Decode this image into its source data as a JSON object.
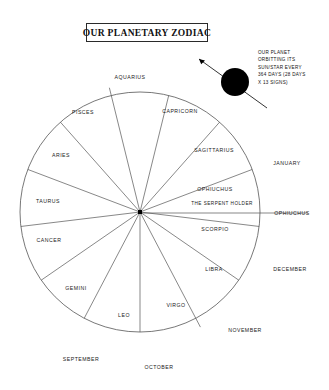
{
  "title": {
    "text": "OUR PLANETARY ZODIAC"
  },
  "annotation": {
    "lines": [
      "OUR PLANET",
      "ORBITTING ITS",
      "SUN/STAR EVERY",
      "364 DAYS (28 DAYS",
      "X 13 SIGNS)"
    ]
  },
  "wheel": {
    "center_x": 140,
    "center_y": 212,
    "radius": 120,
    "sector_count": 13,
    "stroke_color": "#555555",
    "planet_color": "#000000"
  },
  "signs": [
    {
      "name": "AQUARIUS",
      "x": 130,
      "y": 77
    },
    {
      "name": "PISCES",
      "x": 83,
      "y": 112
    },
    {
      "name": "ARIES",
      "x": 61,
      "y": 155
    },
    {
      "name": "TAURUS",
      "x": 48,
      "y": 201
    },
    {
      "name": "CANCER",
      "x": 49,
      "y": 240
    },
    {
      "name": "GEMINI",
      "x": 76,
      "y": 288
    },
    {
      "name": "LEO",
      "x": 124,
      "y": 315
    },
    {
      "name": "VIRGO",
      "x": 176,
      "y": 305
    },
    {
      "name": "LIBRA",
      "x": 214,
      "y": 269
    },
    {
      "name": "SCORPIO",
      "x": 215,
      "y": 229
    },
    {
      "name": "OPHIUCHUS",
      "x": 215,
      "y": 189
    },
    {
      "name": "SAGITTARIUS",
      "x": 214,
      "y": 150
    },
    {
      "name": "CAPRICORN",
      "x": 180,
      "y": 111
    }
  ],
  "sign_subtitle": {
    "name": "THE SERPENT HOLDER",
    "x": 222,
    "y": 203
  },
  "outer_labels": [
    {
      "name": "JANUARY",
      "x": 287,
      "y": 163
    },
    {
      "name": "OPHIUCHUS",
      "x": 292,
      "y": 213
    },
    {
      "name": "DECEMBER",
      "x": 290,
      "y": 269
    },
    {
      "name": "NOVEMBER",
      "x": 245,
      "y": 330
    },
    {
      "name": "OCTOBER",
      "x": 159,
      "y": 367
    },
    {
      "name": "SEPTEMBER",
      "x": 81,
      "y": 359
    }
  ],
  "planet": {
    "label": "planet-body",
    "x": 235,
    "y": 82,
    "r": 14
  }
}
